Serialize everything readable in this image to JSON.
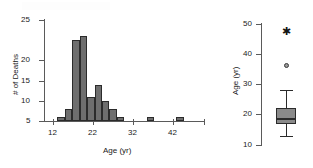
{
  "figure": {
    "background": "#ffffff",
    "bar_fill": "#6e6e6e",
    "bar_edge": "#2b2b2b",
    "axis_color": "#5a5a5a",
    "box_fill": "#8a8a8a"
  },
  "chart_data": [
    {
      "type": "bar",
      "title": "",
      "xlabel": "Age (yr)",
      "ylabel": "# of Deaths",
      "xlim": [
        10,
        52
      ],
      "ylim": [
        0,
        25
      ],
      "xticks": [
        12,
        22,
        32,
        42
      ],
      "yticks": [
        5,
        10,
        15,
        20,
        25
      ],
      "grid": false,
      "bin_width": 2,
      "bin_starts": [
        12,
        14,
        16,
        18,
        20,
        22,
        24,
        26,
        28,
        36,
        44
      ],
      "categories": [
        "12-14",
        "14-16",
        "16-18",
        "18-20",
        "20-22",
        "22-24",
        "24-26",
        "26-28",
        "28-30",
        "36-38",
        "44-46"
      ],
      "values": [
        1,
        3,
        20,
        21,
        6,
        9,
        5,
        3,
        1,
        1,
        1
      ]
    },
    {
      "type": "box",
      "title": "",
      "xlabel": "",
      "ylabel": "Age (yr)",
      "ylim": [
        10,
        50
      ],
      "yticks": [
        10,
        20,
        30,
        40,
        50
      ],
      "grid": false,
      "box": {
        "whisker_low": 13,
        "q1": 17,
        "median": 19,
        "q3": 22,
        "whisker_high": 28
      },
      "outliers": [
        {
          "value": 47,
          "marker": "star"
        },
        {
          "value": 36,
          "marker": "circle"
        }
      ]
    }
  ],
  "labels": {
    "hist_y_title": "# of Deaths",
    "hist_x_title": "Age (yr)",
    "hist_yticks": [
      "5",
      "10",
      "15",
      "20",
      "25"
    ],
    "hist_xticks": [
      "12",
      "22",
      "32",
      "42"
    ],
    "box_y_title": "Age (yr)",
    "box_yticks": [
      "10",
      "20",
      "30",
      "40",
      "50"
    ]
  }
}
